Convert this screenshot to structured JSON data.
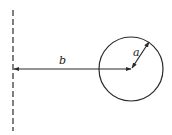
{
  "diagram": {
    "labels": {
      "distance": "b",
      "radius": "a"
    },
    "colors": {
      "stroke": "#2a2a2a",
      "background": "#ffffff"
    },
    "geometry": {
      "boundary_x": 13,
      "boundary_y_top": 10,
      "boundary_y_bottom": 131,
      "circle_cx": 131,
      "circle_cy": 69,
      "circle_r": 32,
      "radius_end_x": 149,
      "radius_end_y": 42
    }
  }
}
